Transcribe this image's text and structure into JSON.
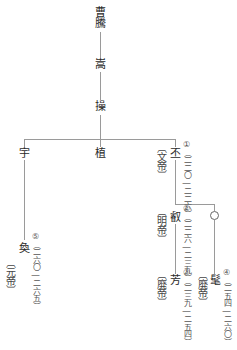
{
  "diagram": {
    "type": "family-tree",
    "nodes": {
      "caoteng": {
        "name": "曹騰"
      },
      "song": {
        "name": "嵩"
      },
      "cao": {
        "name": "操"
      },
      "yu": {
        "name": "宇"
      },
      "zhi": {
        "name": "植"
      },
      "pi": {
        "name": "丕",
        "title": "〔文帝〕",
        "reign": "①（二二〇―二二六）"
      },
      "rui": {
        "name": "叡",
        "title": "〔明帝〕",
        "reign": "②（二二六―二三九）"
      },
      "unknown": {
        "name": "○"
      },
      "fang": {
        "name": "芳",
        "title": "〔廃帝〕",
        "reign": "③（二三九―二五四）"
      },
      "mao": {
        "name": "髦",
        "title": "〔廃帝〕",
        "reign": "④（二五四―二六〇）"
      },
      "huan": {
        "name": "奐",
        "title": "〔元帝〕",
        "reign": "⑤（二六〇―二六五）"
      }
    },
    "edges": [
      [
        "caoteng",
        "song"
      ],
      [
        "song",
        "cao"
      ],
      [
        "cao",
        "yu"
      ],
      [
        "cao",
        "zhi"
      ],
      [
        "cao",
        "pi"
      ],
      [
        "yu",
        "huan"
      ],
      [
        "pi",
        "rui"
      ],
      [
        "pi",
        "unknown"
      ],
      [
        "rui",
        "fang"
      ],
      [
        "unknown",
        "mao"
      ]
    ],
    "colors": {
      "line": "#9a9a9a",
      "text": "#2a2a2a"
    }
  }
}
